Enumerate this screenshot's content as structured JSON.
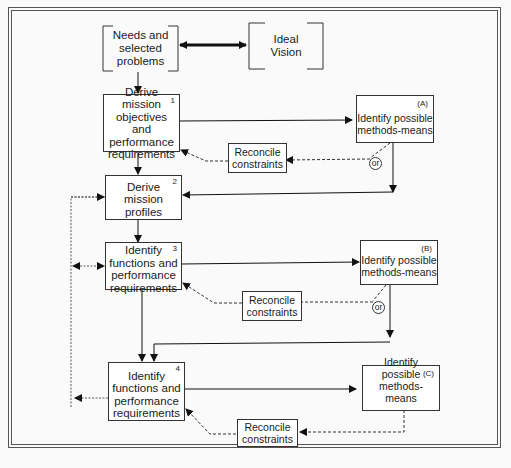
{
  "diagram": {
    "type": "flowchart",
    "top": {
      "needs": "Needs and selected problems",
      "vision": "Ideal Vision"
    },
    "steps": [
      {
        "num": "1",
        "label": "Derive mission objectives and performance requirements"
      },
      {
        "num": "2",
        "label": "Derive mission profiles"
      },
      {
        "num": "3",
        "label": "Identify functions and performance requirements"
      },
      {
        "num": "4",
        "label": "Identify functions and performance requirements"
      }
    ],
    "methods": [
      {
        "tag": "(A)",
        "label": "Identify possible methods-means"
      },
      {
        "tag": "(B)",
        "label": "Identify possible methods-means"
      },
      {
        "tag": "(C)",
        "label": "Identify possible methods-means"
      }
    ],
    "reconcile": [
      {
        "label": "Reconcile constraints"
      },
      {
        "label": "Reconcile constraints"
      },
      {
        "label": "Reconcile constraints"
      }
    ],
    "or_label": "or"
  }
}
